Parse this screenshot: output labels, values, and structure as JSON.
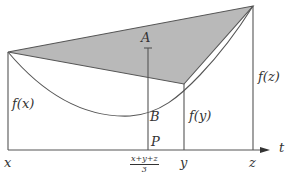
{
  "diagram": {
    "colors": {
      "shade": "#b9b9b9",
      "line": "#555555",
      "text": "#333333"
    },
    "labels": {
      "fx": "f(x)",
      "fy": "f(y)",
      "fz": "f(z)",
      "A": "A",
      "B": "B",
      "P": "P",
      "x": "x",
      "y": "y",
      "z": "z",
      "t": "t",
      "mean_num": "x+y+z",
      "mean_den": "3"
    },
    "points": {
      "x_left": [
        8,
        52
      ],
      "y_point": [
        184,
        84
      ],
      "z_right": [
        253,
        6
      ],
      "mean_p": [
        148,
        150
      ],
      "A": [
        148,
        47
      ],
      "B": [
        148,
        108
      ]
    }
  }
}
